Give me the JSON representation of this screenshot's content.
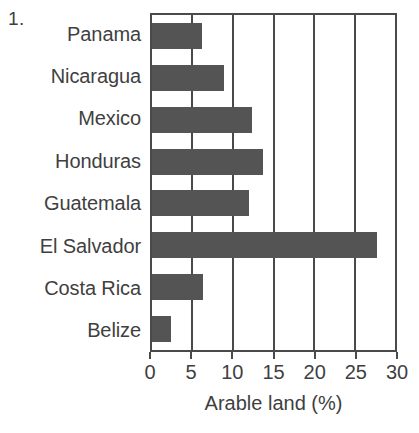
{
  "figure": {
    "number_label": "1."
  },
  "chart_data": {
    "type": "bar",
    "orientation": "horizontal",
    "title": "",
    "xlabel": "Arable land (%)",
    "ylabel": "",
    "xlim": [
      0,
      30
    ],
    "xticks": [
      0,
      5,
      10,
      15,
      20,
      25,
      30
    ],
    "xtick_labels": [
      "0",
      "5",
      "10",
      "15",
      "20",
      "25",
      "30"
    ],
    "grid": true,
    "grid_axis": "x",
    "legend": false,
    "categories": [
      "Panama",
      "Nicaragua",
      "Mexico",
      "Honduras",
      "Guatemala",
      "El Salvador",
      "Costa Rica",
      "Belize"
    ],
    "values": [
      6.2,
      8.9,
      12.3,
      13.7,
      12.0,
      27.8,
      6.3,
      2.3
    ],
    "bar_color": "#545454",
    "axis_color": "#4a4a4a"
  }
}
